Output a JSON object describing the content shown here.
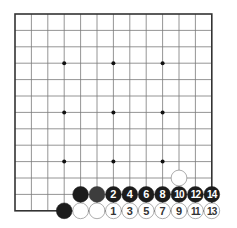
{
  "board": {
    "size": 13,
    "origin_x": 15,
    "origin_y": 14,
    "spacing": 16.4,
    "line_color": "#7a7a7a",
    "border_color": "#333333",
    "star_points": [
      [
        3,
        3
      ],
      [
        6,
        3
      ],
      [
        9,
        3
      ],
      [
        3,
        6
      ],
      [
        6,
        6
      ],
      [
        9,
        6
      ],
      [
        3,
        9
      ],
      [
        6,
        9
      ],
      [
        9,
        9
      ]
    ]
  },
  "stones": [
    {
      "col": 3,
      "row": 12,
      "color": "black",
      "label": ""
    },
    {
      "col": 4,
      "row": 12,
      "color": "white",
      "label": ""
    },
    {
      "col": 5,
      "row": 12,
      "color": "white",
      "label": ""
    },
    {
      "col": 6,
      "row": 12,
      "color": "white",
      "label": "1"
    },
    {
      "col": 7,
      "row": 12,
      "color": "white",
      "label": "3"
    },
    {
      "col": 8,
      "row": 12,
      "color": "white",
      "label": "5"
    },
    {
      "col": 9,
      "row": 12,
      "color": "white",
      "label": "7"
    },
    {
      "col": 10,
      "row": 12,
      "color": "white",
      "label": "9"
    },
    {
      "col": 11,
      "row": 12,
      "color": "white",
      "label": "11"
    },
    {
      "col": 12,
      "row": 12,
      "color": "white",
      "label": "13"
    },
    {
      "col": 4,
      "row": 11,
      "color": "black",
      "label": ""
    },
    {
      "col": 5,
      "row": 11,
      "color": "grey",
      "label": ""
    },
    {
      "col": 6,
      "row": 11,
      "color": "black",
      "label": "2"
    },
    {
      "col": 7,
      "row": 11,
      "color": "black",
      "label": "4"
    },
    {
      "col": 8,
      "row": 11,
      "color": "black",
      "label": "6"
    },
    {
      "col": 9,
      "row": 11,
      "color": "black",
      "label": "8"
    },
    {
      "col": 10,
      "row": 11,
      "color": "black",
      "label": "10"
    },
    {
      "col": 11,
      "row": 11,
      "color": "black",
      "label": "12"
    },
    {
      "col": 12,
      "row": 11,
      "color": "black",
      "label": "14"
    },
    {
      "col": 10,
      "row": 10,
      "color": "white",
      "label": ""
    }
  ],
  "colors": {
    "black": "#1c1c1c",
    "grey": "#3d3d3d",
    "white": "#ffffff",
    "white_outline": "#8a8a8a",
    "black_text": "#ffffff",
    "white_text": "#333333"
  }
}
